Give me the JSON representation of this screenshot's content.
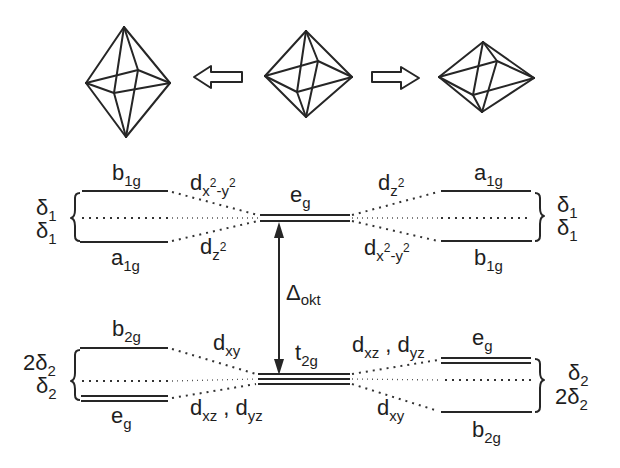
{
  "figure": {
    "type": "crystal-field splitting diagram",
    "octahedra": [
      {
        "id": "elongated",
        "top": [
          124,
          27
        ],
        "left": [
          86,
          83
        ],
        "right": [
          170,
          83
        ],
        "bottom": [
          126,
          137
        ],
        "back": [
          138,
          70
        ],
        "front": [
          114,
          93
        ]
      },
      {
        "id": "regular",
        "top": [
          306,
          31
        ],
        "left": [
          265,
          76
        ],
        "right": [
          352,
          77
        ],
        "bottom": [
          306,
          117
        ],
        "back": [
          318,
          61
        ],
        "front": [
          297,
          92
        ]
      },
      {
        "id": "compressed",
        "top": [
          483,
          42
        ],
        "left": [
          439,
          77
        ],
        "right": [
          534,
          78
        ],
        "bottom": [
          482,
          112
        ],
        "back": [
          497,
          61
        ],
        "front": [
          473,
          95
        ]
      }
    ],
    "arrows": [
      {
        "id": "arrow-left",
        "direction": "left"
      },
      {
        "id": "arrow-right",
        "direction": "right"
      }
    ],
    "delta_label": {
      "symbol": "Δ",
      "sub": "okt"
    }
  },
  "center": {
    "eg": {
      "main": "e",
      "sub": "g"
    },
    "t2g": {
      "main": "t",
      "sub": "2g"
    }
  },
  "left_upper": {
    "top": {
      "main": "b",
      "sub": "1g"
    },
    "bottom": {
      "main": "a",
      "sub": "1g"
    },
    "orbital_top": {
      "main": "d",
      "sub": "x",
      "sup1": "2",
      "mid": "-y",
      "sup2": "2"
    },
    "orbital_bottom": {
      "main": "d",
      "sub": "z",
      "sup": "2"
    },
    "delta_top": {
      "main": "δ",
      "sub": "1"
    },
    "delta_bottom": {
      "main": "δ",
      "sub": "1"
    }
  },
  "right_upper": {
    "top": {
      "main": "a",
      "sub": "1g"
    },
    "bottom": {
      "main": "b",
      "sub": "1g"
    },
    "orbital_top": {
      "main": "d",
      "sub": "z",
      "sup": "2"
    },
    "orbital_bottom": {
      "main": "d",
      "sub": "x",
      "sup1": "2",
      "mid": "-y",
      "sup2": "2"
    },
    "delta_top": {
      "main": "δ",
      "sub": "1"
    },
    "delta_bottom": {
      "main": "δ",
      "sub": "1"
    }
  },
  "left_lower": {
    "top": {
      "main": "b",
      "sub": "2g"
    },
    "bottom": {
      "main": "e",
      "sub": "g"
    },
    "orbital_top": {
      "main": "d",
      "sub": "xy"
    },
    "orbital_bottom": {
      "a": "d",
      "a_sub": "xz",
      "sep": " , ",
      "b": "d",
      "b_sub": "yz"
    },
    "delta_top": {
      "pre": "2",
      "main": "δ",
      "sub": "2"
    },
    "delta_bottom": {
      "pre": "",
      "main": "δ",
      "sub": "2"
    }
  },
  "right_lower": {
    "top": {
      "main": "e",
      "sub": "g"
    },
    "bottom": {
      "main": "b",
      "sub": "2g"
    },
    "orbital_top": {
      "a": "d",
      "a_sub": "xz",
      "sep": " , ",
      "b": "d",
      "b_sub": "yz"
    },
    "orbital_bottom": {
      "main": "d",
      "sub": "xy"
    },
    "delta_top": {
      "pre": "",
      "main": "δ",
      "sub": "2"
    },
    "delta_bottom": {
      "pre": "2",
      "main": "δ",
      "sub": "2"
    }
  }
}
